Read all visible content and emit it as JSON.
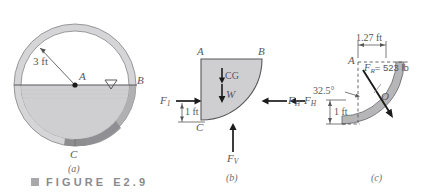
{
  "figure": {
    "caption_label": "FIGURE",
    "caption_number": "E2.9",
    "bullet_icon": "square-bullet-icon"
  },
  "panels": [
    {
      "id": "a",
      "caption": "(a)",
      "name": "pipe-cross-section",
      "labels": {
        "radius": "3 ft",
        "center_point": "A",
        "right_point": "B",
        "bottom_point": "C",
        "free_surface_icon": "water-surface-triangle-icon"
      }
    },
    {
      "id": "b",
      "caption": "(b)",
      "name": "free-body-diagram",
      "labels": {
        "top_left": "A",
        "top_right": "B",
        "bottom_left": "C",
        "force_1": "F",
        "force_1_sub": "1",
        "force_h": "F",
        "force_h_sub": "H",
        "force_v": "F",
        "force_v_sub": "V",
        "weight": "W",
        "cg": "CG",
        "dim_vertical": "1 ft"
      }
    },
    {
      "id": "c",
      "caption": "(c)",
      "name": "resultant-force-diagram",
      "labels": {
        "corner": "A",
        "dim_horizontal": "1.27 ft",
        "dim_vertical": "1 ft",
        "angle": "32.5°",
        "resultant": "F",
        "resultant_sub": "R",
        "resultant_value": "= 523 lb",
        "point_o": "O",
        "force_h_left": "F",
        "force_h_left_sub": "H"
      }
    }
  ],
  "colors": {
    "fluid_fill": "#cfcfd1",
    "wall_light": "#d9d9db",
    "wall_dark": "#9a9a9d",
    "line": "#58585a",
    "caption_gray": "#8b8b8e"
  }
}
